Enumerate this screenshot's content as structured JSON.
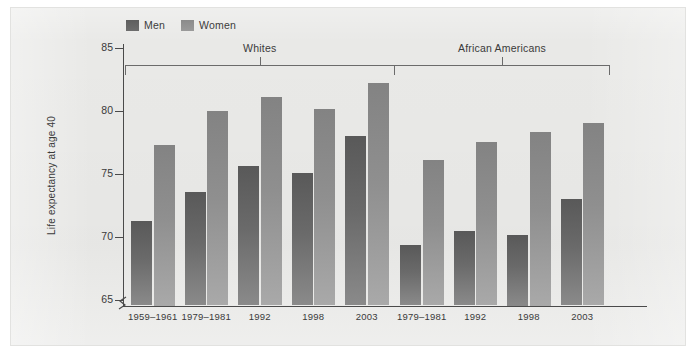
{
  "chart_data": {
    "type": "bar",
    "title": "",
    "xlabel": "",
    "ylabel": "Life expectancy at age 40",
    "ylim": [
      65,
      86.5
    ],
    "yticks": [
      65,
      70,
      75,
      80,
      85
    ],
    "grid": false,
    "legend_position": "top-left",
    "axis_break": true,
    "legend": [
      {
        "name": "Men",
        "color": "#5e5e5e"
      },
      {
        "name": "Women",
        "color": "#8b8b8b"
      }
    ],
    "groups": [
      {
        "label": "Whites",
        "categories": [
          "1959–1961",
          "1979–1981",
          "1992",
          "1998",
          "2003"
        ],
        "series": [
          {
            "name": "Men",
            "values": [
              71.6,
              73.8,
              75.8,
              75.3,
              78.2
            ]
          },
          {
            "name": "Women",
            "values": [
              77.5,
              80.1,
              81.2,
              80.3,
              82.3
            ]
          }
        ]
      },
      {
        "label": "African Americans",
        "categories": [
          "1979–1981",
          "1992",
          "1998",
          "2003"
        ],
        "series": [
          {
            "name": "Men",
            "values": [
              69.7,
              70.8,
              70.5,
              73.3
            ]
          },
          {
            "name": "Women",
            "values": [
              76.3,
              77.7,
              78.5,
              79.2
            ]
          }
        ]
      }
    ]
  },
  "colors": {
    "men_bar_top": "#595959",
    "men_bar_bottom": "#8a8a8a",
    "women_bar_top": "#838383",
    "women_bar_bottom": "#a9a9a9",
    "axis": "#4a4a4a",
    "panel_background": "#e9e9e7",
    "text": "#3a3a3a"
  }
}
